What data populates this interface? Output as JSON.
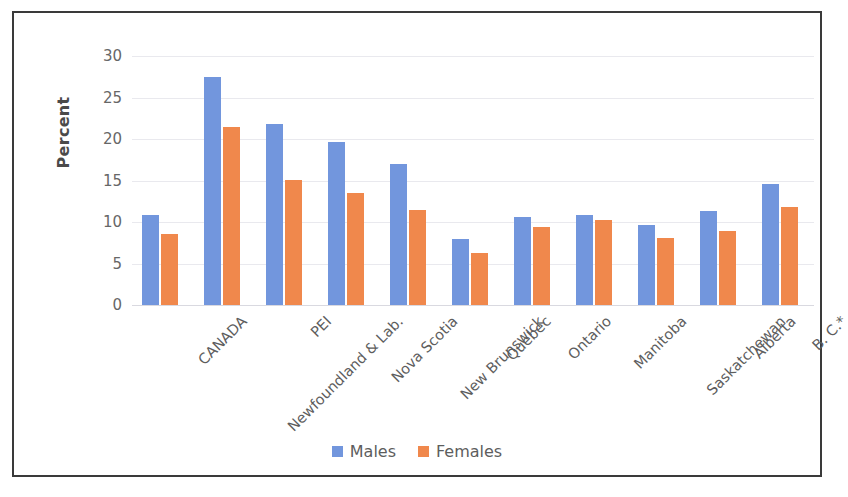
{
  "frame": {
    "border_color": "#3a3a3a",
    "background": "#ffffff"
  },
  "chart_data": {
    "type": "bar",
    "title": "",
    "subtitle": "",
    "xlabel": "",
    "ylabel": "Percent",
    "ylim": [
      0,
      30
    ],
    "ytick_values": [
      30,
      25,
      20,
      15,
      10,
      5,
      0
    ],
    "ytick_labels": [
      "30",
      "25",
      "20",
      "15",
      "10",
      "5",
      "0"
    ],
    "grid": true,
    "grid_axis": "y",
    "legend_position": "bottom-center",
    "categories": [
      "CANADA",
      "Newfoundland & Lab.",
      "PEI",
      "Nova Scotia",
      "New Brunswick",
      "Quebec",
      "Ontario",
      "Manitoba",
      "Saskatchewan",
      "Alberta",
      "B. C.*"
    ],
    "series": [
      {
        "name": "Males",
        "color": "#7296dd",
        "values": [
          10.8,
          27.5,
          21.8,
          19.7,
          17.0,
          8.0,
          10.6,
          10.9,
          9.7,
          11.3,
          14.6
        ]
      },
      {
        "name": "Females",
        "color": "#f0884c",
        "values": [
          8.5,
          21.4,
          15.1,
          13.5,
          11.5,
          6.3,
          9.4,
          10.2,
          8.1,
          8.9,
          11.8
        ]
      }
    ]
  },
  "legend": {
    "items": [
      {
        "label": "Males",
        "color": "#7296dd"
      },
      {
        "label": "Females",
        "color": "#f0884c"
      }
    ]
  }
}
